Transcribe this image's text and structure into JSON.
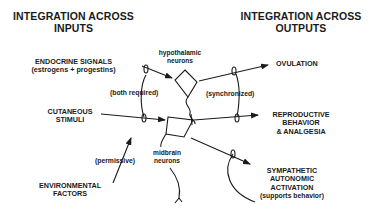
{
  "headings": {
    "inputs": [
      "INTEGRATION ACROSS",
      "INPUTS"
    ],
    "outputs": [
      "INTEGRATION ACROSS",
      "OUTPUTS"
    ]
  },
  "inputs": [
    {
      "id": "endocrine",
      "lines": [
        "ENDOCRINE SIGNALS",
        "(estrogens + progestins)"
      ]
    },
    {
      "id": "cutaneous",
      "lines": [
        "CUTANEOUS",
        "STIMULI"
      ]
    },
    {
      "id": "environmental",
      "lines": [
        "ENVIRONMENTAL",
        "FACTORS"
      ]
    }
  ],
  "neurons": {
    "hypothalamic": [
      "hypothalamic",
      "neurons"
    ],
    "midbrain": [
      "midbrain",
      "neurons"
    ]
  },
  "outputs": [
    {
      "id": "ovulation",
      "lines": [
        "OVULATION"
      ]
    },
    {
      "id": "reproductive",
      "lines": [
        "REPRODUCTIVE",
        "BEHAVIOR",
        "& ANALGESIA"
      ]
    },
    {
      "id": "sympathetic",
      "lines": [
        "SYMPATHETIC",
        "AUTONOMIC",
        "ACTIVATION",
        "(supports behavior)"
      ]
    }
  ],
  "annotations": {
    "both_required": "(both required)",
    "synchronized": "(synchronized)",
    "permissive": "(permissive)"
  }
}
